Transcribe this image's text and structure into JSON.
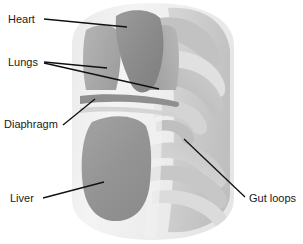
{
  "figure": {
    "type": "labeled-anatomical-illustration",
    "background_color": "#ffffff",
    "palette": {
      "body_outline_light": "#ededed",
      "body_fill": "#f2f2f2",
      "organ_dark_gray": "#8c8c8c",
      "organ_mid_gray": "#a8a8a8",
      "organ_light_gray": "#c9c9c9",
      "organ_pale_gray": "#dcdcdc",
      "leader_line": "#111111",
      "label_text": "#1a1a1a"
    },
    "labels": [
      {
        "id": "heart",
        "text": "Heart",
        "text_x": 8,
        "text_y": 23,
        "leaders": [
          {
            "x1": 44,
            "y1": 19,
            "x2": 127,
            "y2": 27
          }
        ]
      },
      {
        "id": "lungs",
        "text": "Lungs",
        "text_x": 8,
        "text_y": 66,
        "leaders": [
          {
            "x1": 44,
            "y1": 62,
            "x2": 107,
            "y2": 68
          },
          {
            "x1": 44,
            "y1": 63,
            "x2": 159,
            "y2": 89
          }
        ]
      },
      {
        "id": "diaphragm",
        "text": "Diaphragm",
        "text_x": 4,
        "text_y": 128,
        "leaders": [
          {
            "x1": 63,
            "y1": 125,
            "x2": 95,
            "y2": 99
          }
        ]
      },
      {
        "id": "liver",
        "text": "Liver",
        "text_x": 10,
        "text_y": 202,
        "leaders": [
          {
            "x1": 43,
            "y1": 198,
            "x2": 104,
            "y2": 182
          }
        ]
      },
      {
        "id": "gut-loops",
        "text": "Gut loops",
        "text_x": 249,
        "text_y": 202,
        "leaders": [
          {
            "x1": 245,
            "y1": 197,
            "x2": 184,
            "y2": 139
          }
        ]
      }
    ],
    "organs": [
      {
        "id": "heart",
        "name": "Heart",
        "shade": "#8c8c8c"
      },
      {
        "id": "lungs",
        "name": "Lungs",
        "shade": "#a8a8a8"
      },
      {
        "id": "diaphragm",
        "name": "Diaphragm",
        "shade": "#9a9a9a"
      },
      {
        "id": "liver",
        "name": "Liver",
        "shade": "#969696"
      },
      {
        "id": "gut-loops",
        "name": "Gut loops",
        "shade": "#c9c9c9"
      }
    ]
  }
}
